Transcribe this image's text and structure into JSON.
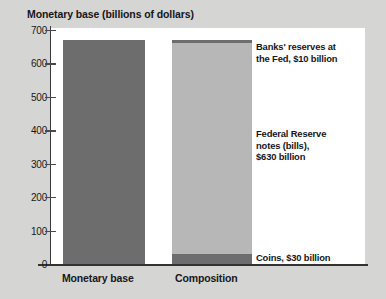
{
  "chart_data": {
    "type": "bar",
    "title": "Monetary base (billions of dollars)",
    "xlabel": "",
    "ylabel": "Monetary base (billions of dollars)",
    "ylim": [
      0,
      700
    ],
    "yticks": [
      0,
      100,
      200,
      300,
      400,
      500,
      600,
      700
    ],
    "ytick_labels": [
      "0",
      "100",
      "200",
      "300",
      "400",
      "500",
      "600",
      "700"
    ],
    "grid": false,
    "legend": "none",
    "categories": [
      "Monetary base",
      "Composition"
    ],
    "series": [
      {
        "name": "Monetary base",
        "stacked": false,
        "values": [
          670,
          null
        ],
        "color": "#6d6d6d"
      },
      {
        "name": "Coins",
        "stacked": true,
        "values": [
          null,
          30
        ],
        "color": "#6d6d6d"
      },
      {
        "name": "Federal Reserve notes (bills)",
        "stacked": true,
        "values": [
          null,
          630
        ],
        "color": "#b7b7b7"
      },
      {
        "name": "Banks' reserves at the Fed",
        "stacked": true,
        "values": [
          null,
          10
        ],
        "color": "#6d6d6d"
      }
    ],
    "annotations": [
      {
        "id": "reserves",
        "lines": [
          "Banks' reserves at",
          "the Fed, $10 billion"
        ],
        "value": 10
      },
      {
        "id": "notes",
        "lines": [
          "Federal Reserve",
          "notes (bills),",
          "$630 billion"
        ],
        "value": 630
      },
      {
        "id": "coins",
        "lines": [
          "Coins, $30 billion"
        ],
        "value": 30
      }
    ]
  },
  "colors": {
    "background": "#d5d5d3",
    "plot_background": "#ffffff",
    "bar_dark": "#6d6d6d",
    "bar_light": "#b7b7b7",
    "axis": "#333335",
    "text": "#16161a"
  }
}
